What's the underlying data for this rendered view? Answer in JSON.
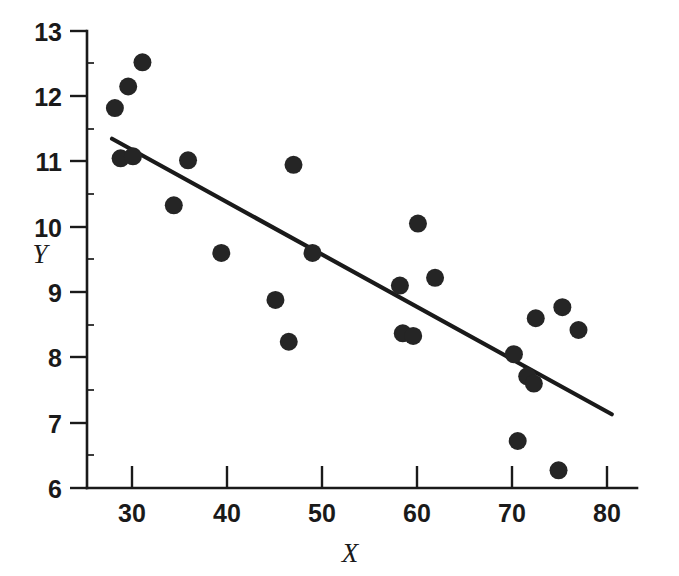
{
  "chart_data": {
    "type": "scatter",
    "title": "",
    "subtitle": "",
    "xlabel": "X",
    "ylabel": "Y",
    "xlim": [
      26,
      85
    ],
    "ylim": [
      6,
      13
    ],
    "xticks": [
      30,
      40,
      50,
      60,
      70,
      80
    ],
    "yticks": [
      6,
      7,
      8,
      9,
      10,
      11,
      12,
      13
    ],
    "xtick_labels": [
      "30",
      "40",
      "50",
      "60",
      "70",
      "80"
    ],
    "ytick_labels": [
      "6",
      "7",
      "8",
      "9",
      "10",
      "11",
      "12",
      "13"
    ],
    "grid": false,
    "legend": null,
    "legend_position": "none",
    "marker": "filled-circle",
    "marker_color": "#252525",
    "marker_size": 9,
    "series": [
      {
        "name": "observations",
        "x": [
          28.2,
          29.6,
          31.1,
          28.8,
          30.1,
          34.4,
          35.9,
          39.4,
          45.1,
          46.5,
          47.0,
          49.0,
          58.2,
          58.5,
          59.6,
          60.1,
          61.9,
          70.2,
          70.6,
          71.6,
          72.3,
          72.5,
          74.9,
          75.3,
          77.0
        ],
        "y": [
          11.82,
          12.15,
          12.52,
          11.05,
          11.08,
          10.33,
          11.02,
          9.6,
          8.88,
          8.24,
          10.95,
          9.6,
          9.1,
          8.37,
          8.33,
          10.05,
          9.22,
          8.05,
          6.72,
          7.71,
          7.6,
          8.6,
          6.27,
          8.77,
          8.42
        ]
      }
    ],
    "fit_line": {
      "name": "regression-line",
      "x_start": 27.9,
      "y_start": 11.35,
      "x_end": 80.5,
      "y_end": 7.13,
      "color": "#1a1a1a"
    },
    "axis_color": "#1a1a1a",
    "background_color": "#ffffff"
  }
}
